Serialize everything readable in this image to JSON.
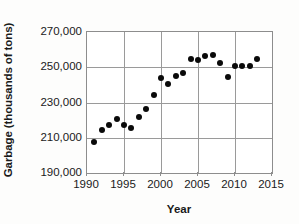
{
  "chart_data": {
    "type": "scatter",
    "title": "",
    "xlabel": "Year",
    "ylabel": "Garbage (thousands of tons)",
    "xlim": [
      1990,
      2015
    ],
    "ylim": [
      190000,
      270000
    ],
    "xticks": [
      1990,
      1995,
      2000,
      2005,
      2010,
      2015
    ],
    "xtick_labels": [
      "1990",
      "1995",
      "2000",
      "2005",
      "2010",
      "2015"
    ],
    "yticks": [
      190000,
      210000,
      230000,
      250000,
      270000
    ],
    "ytick_labels": [
      "190,000",
      "210,000",
      "230,000",
      "250,000",
      "270,000"
    ],
    "grid": true,
    "legend": null,
    "marker": "filled-circle",
    "marker_color": "#0a0a0a",
    "x": [
      1991,
      1992,
      1993,
      1994,
      1995,
      1996,
      1997,
      1998,
      1999,
      2000,
      2001,
      2002,
      2003,
      2004,
      2005,
      2006,
      2007,
      2008,
      2009,
      2010,
      2011,
      2012,
      2013
    ],
    "values": [
      207500,
      214500,
      217000,
      220500,
      217000,
      215500,
      222000,
      226500,
      234500,
      244000,
      240500,
      245000,
      246500,
      254500,
      254000,
      256500,
      257000,
      252500,
      244500,
      250500,
      250500,
      250500,
      254500
    ],
    "points": [
      {
        "year": 1991,
        "garbage": 207500
      },
      {
        "year": 1992,
        "garbage": 214500
      },
      {
        "year": 1993,
        "garbage": 217000
      },
      {
        "year": 1994,
        "garbage": 220500
      },
      {
        "year": 1995,
        "garbage": 217000
      },
      {
        "year": 1996,
        "garbage": 215500
      },
      {
        "year": 1997,
        "garbage": 222000
      },
      {
        "year": 1998,
        "garbage": 226500
      },
      {
        "year": 1999,
        "garbage": 234500
      },
      {
        "year": 2000,
        "garbage": 244000
      },
      {
        "year": 2001,
        "garbage": 240500
      },
      {
        "year": 2002,
        "garbage": 245000
      },
      {
        "year": 2003,
        "garbage": 246500
      },
      {
        "year": 2004,
        "garbage": 254500
      },
      {
        "year": 2005,
        "garbage": 254000
      },
      {
        "year": 2006,
        "garbage": 256500
      },
      {
        "year": 2007,
        "garbage": 257000
      },
      {
        "year": 2008,
        "garbage": 252500
      },
      {
        "year": 2009,
        "garbage": 244500
      },
      {
        "year": 2010,
        "garbage": 250500
      },
      {
        "year": 2011,
        "garbage": 250500
      },
      {
        "year": 2012,
        "garbage": 250500
      },
      {
        "year": 2013,
        "garbage": 254500
      }
    ]
  }
}
